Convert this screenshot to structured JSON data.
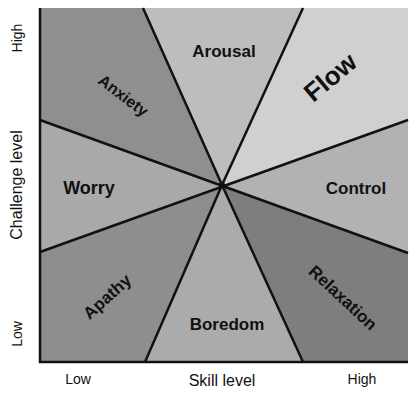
{
  "diagram": {
    "x_axis": {
      "label": "Skill level",
      "low": "Low",
      "high": "High"
    },
    "y_axis": {
      "label": "Challenge level",
      "low": "Low",
      "high": "High"
    },
    "regions": [
      {
        "name": "Arousal",
        "color": "#bdbdbd"
      },
      {
        "name": "Flow",
        "color": "#d0d0d0"
      },
      {
        "name": "Control",
        "color": "#b2b2b2"
      },
      {
        "name": "Relaxation",
        "color": "#7e7e7e"
      },
      {
        "name": "Boredom",
        "color": "#ababab"
      },
      {
        "name": "Apathy",
        "color": "#8e8e8e"
      },
      {
        "name": "Worry",
        "color": "#a9a9a9"
      },
      {
        "name": "Anxiety",
        "color": "#8f8f8f"
      }
    ]
  }
}
